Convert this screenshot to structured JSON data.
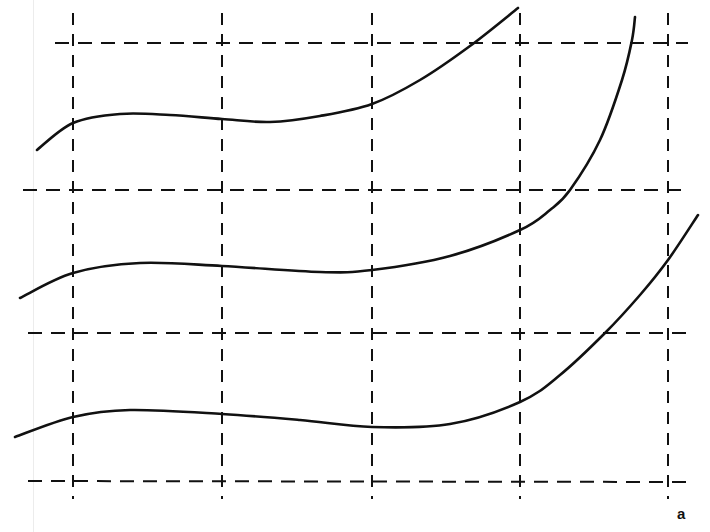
{
  "figure": {
    "panel_label": "a",
    "stroke_color": "#111111",
    "background": "#ffffff",
    "grid": {
      "style": "dashed",
      "vertical_lines_x": [
        73,
        222,
        372,
        520,
        668
      ],
      "horizontal_lines_y": [
        43,
        190,
        333,
        481
      ]
    },
    "curves": [
      {
        "name": "top-curve",
        "points": [
          [
            37,
            150
          ],
          [
            73,
            123
          ],
          [
            120,
            114
          ],
          [
            170,
            115
          ],
          [
            222,
            119
          ],
          [
            270,
            122
          ],
          [
            320,
            116
          ],
          [
            372,
            104
          ],
          [
            420,
            80
          ],
          [
            470,
            46
          ],
          [
            518,
            8
          ]
        ]
      },
      {
        "name": "middle-curve",
        "points": [
          [
            20,
            298
          ],
          [
            73,
            273
          ],
          [
            140,
            263
          ],
          [
            222,
            266
          ],
          [
            320,
            272
          ],
          [
            372,
            270
          ],
          [
            450,
            256
          ],
          [
            520,
            230
          ],
          [
            550,
            210
          ],
          [
            570,
            190
          ],
          [
            600,
            140
          ],
          [
            622,
            80
          ],
          [
            632,
            40
          ],
          [
            635,
            17
          ]
        ]
      },
      {
        "name": "bottom-curve",
        "points": [
          [
            15,
            437
          ],
          [
            73,
            417
          ],
          [
            130,
            410
          ],
          [
            222,
            414
          ],
          [
            300,
            420
          ],
          [
            372,
            427
          ],
          [
            450,
            424
          ],
          [
            520,
            402
          ],
          [
            560,
            375
          ],
          [
            605,
            333
          ],
          [
            640,
            295
          ],
          [
            668,
            260
          ],
          [
            698,
            215
          ]
        ]
      }
    ]
  }
}
